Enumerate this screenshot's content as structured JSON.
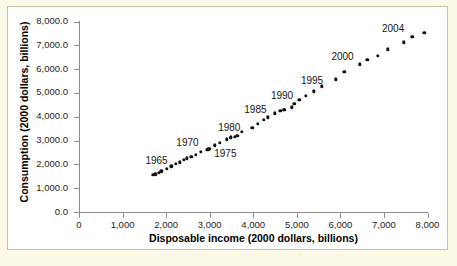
{
  "figure": {
    "background_color": "#fbf8e8",
    "panel_color": "#ffffff",
    "border_color": "#c9c3a4",
    "axis_color": "#8d8d8d",
    "marker_color": "#111111"
  },
  "chart_data": {
    "type": "scatter",
    "title": "",
    "xlabel": "Disposable income (2000 dollars, billions)",
    "ylabel": "Consumption (2000 dollars, billions)",
    "xlim": [
      0,
      8000
    ],
    "ylim": [
      0,
      8000
    ],
    "grid": false,
    "legend": "none",
    "xticks": [
      0,
      1000,
      2000,
      3000,
      4000,
      5000,
      6000,
      7000,
      8000
    ],
    "xtick_labels": [
      "0",
      "1,000",
      "2,000",
      "3,000",
      "4,000",
      "5,000",
      "6,000",
      "7,000",
      "8,000"
    ],
    "yticks": [
      0,
      1000,
      2000,
      3000,
      4000,
      5000,
      6000,
      7000,
      8000
    ],
    "ytick_labels": [
      "0.0",
      "1,000.0",
      "2,000.0",
      "3,000.0",
      "4,000.0",
      "5,000.0",
      "6,000.0",
      "7,000.0",
      "8,000.0"
    ],
    "points": [
      {
        "year": 1960,
        "x": 1700,
        "y": 1550
      },
      {
        "year": 1961,
        "x": 1750,
        "y": 1580
      },
      {
        "year": 1962,
        "x": 1830,
        "y": 1650
      },
      {
        "year": 1963,
        "x": 1890,
        "y": 1710
      },
      {
        "year": 1964,
        "x": 2010,
        "y": 1810
      },
      {
        "year": 1965,
        "x": 2120,
        "y": 1920
      },
      {
        "year": 1966,
        "x": 2220,
        "y": 2030
      },
      {
        "year": 1967,
        "x": 2310,
        "y": 2080
      },
      {
        "year": 1968,
        "x": 2400,
        "y": 2190
      },
      {
        "year": 1969,
        "x": 2480,
        "y": 2260
      },
      {
        "year": 1970,
        "x": 2580,
        "y": 2310
      },
      {
        "year": 1971,
        "x": 2680,
        "y": 2390
      },
      {
        "year": 1972,
        "x": 2800,
        "y": 2540
      },
      {
        "year": 1973,
        "x": 2970,
        "y": 2640
      },
      {
        "year": 1974,
        "x": 2930,
        "y": 2610
      },
      {
        "year": 1975,
        "x": 3000,
        "y": 2650
      },
      {
        "year": 1976,
        "x": 3120,
        "y": 2800
      },
      {
        "year": 1977,
        "x": 3230,
        "y": 2910
      },
      {
        "year": 1978,
        "x": 3390,
        "y": 3050
      },
      {
        "year": 1979,
        "x": 3480,
        "y": 3130
      },
      {
        "year": 1980,
        "x": 3490,
        "y": 3110
      },
      {
        "year": 1981,
        "x": 3580,
        "y": 3160
      },
      {
        "year": 1982,
        "x": 3630,
        "y": 3200
      },
      {
        "year": 1983,
        "x": 3740,
        "y": 3370
      },
      {
        "year": 1984,
        "x": 3980,
        "y": 3530
      },
      {
        "year": 1985,
        "x": 4100,
        "y": 3700
      },
      {
        "year": 1986,
        "x": 4240,
        "y": 3860
      },
      {
        "year": 1987,
        "x": 4330,
        "y": 3980
      },
      {
        "year": 1988,
        "x": 4500,
        "y": 4140
      },
      {
        "year": 1989,
        "x": 4620,
        "y": 4240
      },
      {
        "year": 1990,
        "x": 4700,
        "y": 4300
      },
      {
        "year": 1991,
        "x": 4710,
        "y": 4300
      },
      {
        "year": 1992,
        "x": 4880,
        "y": 4390
      },
      {
        "year": 1993,
        "x": 4940,
        "y": 4540
      },
      {
        "year": 1994,
        "x": 5060,
        "y": 4720
      },
      {
        "year": 1995,
        "x": 5210,
        "y": 4870
      },
      {
        "year": 1996,
        "x": 5390,
        "y": 5070
      },
      {
        "year": 1997,
        "x": 5570,
        "y": 5280
      },
      {
        "year": 1998,
        "x": 5900,
        "y": 5580
      },
      {
        "year": 1999,
        "x": 6090,
        "y": 5880
      },
      {
        "year": 2000,
        "x": 6450,
        "y": 6200
      },
      {
        "year": 2001,
        "x": 6620,
        "y": 6380
      },
      {
        "year": 2002,
        "x": 6860,
        "y": 6570
      },
      {
        "year": 2003,
        "x": 7090,
        "y": 6830
      },
      {
        "year": 2004,
        "x": 7460,
        "y": 7130
      },
      {
        "year": 2005,
        "x": 7650,
        "y": 7350
      },
      {
        "year": 2006,
        "x": 7930,
        "y": 7530
      }
    ],
    "annotations": [
      {
        "label": "1965",
        "x": 1780,
        "y": 2180
      },
      {
        "label": "1970",
        "x": 2490,
        "y": 2960
      },
      {
        "label": "1975",
        "x": 3360,
        "y": 2470
      },
      {
        "label": "1980",
        "x": 3450,
        "y": 3580
      },
      {
        "label": "1985",
        "x": 4050,
        "y": 4320
      },
      {
        "label": "1990",
        "x": 4660,
        "y": 4900
      },
      {
        "label": "1995",
        "x": 5350,
        "y": 5530
      },
      {
        "label": "2000",
        "x": 6050,
        "y": 6570
      },
      {
        "label": "2004",
        "x": 7210,
        "y": 7720
      }
    ]
  }
}
